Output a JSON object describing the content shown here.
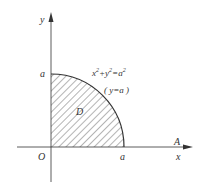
{
  "diagram": {
    "axes": {
      "x_label": "x",
      "y_label": "y",
      "origin_label": "O",
      "extra_label": "A"
    },
    "ticks": {
      "x_intercept": "a",
      "y_intercept": "a"
    },
    "region": {
      "label": "D",
      "description": "Quarter disk in first quadrant, hatched"
    },
    "curve": {
      "equation_left": "x",
      "equation_mid": "+y",
      "equation_right": "=a",
      "sup": "2",
      "note": "( y=a )"
    },
    "colors": {
      "stroke": "#333333",
      "hatch": "#444444",
      "background": "#ffffff"
    }
  }
}
